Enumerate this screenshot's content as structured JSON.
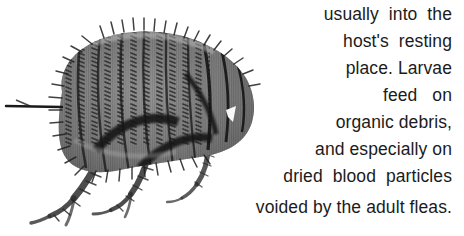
{
  "figure": {
    "colors": {
      "background": "#ffffff",
      "body_dark": "#2a2a2a",
      "body_mid": "#6e6e6e",
      "body_light": "#b5b5b5",
      "text": "#1b1b1b"
    }
  },
  "caption": {
    "full_text": "usually into the host's resting place. Larvae feed on organic debris, and especially on dried blood particles voided by the adult fleas.",
    "lines": [
      {
        "text": "usually  into  the"
      },
      {
        "text": "host's  resting"
      },
      {
        "text": "place. Larvae"
      },
      {
        "text": "feed   on"
      },
      {
        "text": "organic debris,"
      },
      {
        "text": "and especially on"
      },
      {
        "text": "dried  blood  particles"
      },
      {
        "text": "voided by the adult fleas."
      }
    ],
    "alignment": "right",
    "wrap_style": "text-wraps-around-image"
  }
}
